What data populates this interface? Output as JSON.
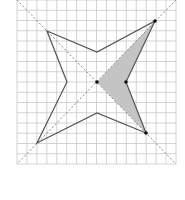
{
  "diagram": {
    "type": "geometry-grid-figure",
    "grid": {
      "x0": 17,
      "y0": 0,
      "x1": 176,
      "y1": 164,
      "cols": 16,
      "rows": 16,
      "line_color": "#c8c8c8"
    },
    "diagonals": [
      {
        "from": [
          17,
          0
        ],
        "to": [
          176,
          164
        ]
      },
      {
        "from": [
          176,
          0
        ],
        "to": [
          17,
          164
        ]
      }
    ],
    "star": {
      "stroke": "#555555",
      "points": [
        [
          47,
          31
        ],
        [
          97,
          52
        ],
        [
          155,
          21
        ],
        [
          126,
          82
        ],
        [
          146,
          133
        ],
        [
          97,
          113
        ],
        [
          37,
          143
        ],
        [
          67,
          82
        ]
      ]
    },
    "shaded_region": {
      "fill": "#c4c4c4",
      "points": [
        [
          97,
          82
        ],
        [
          155,
          21
        ],
        [
          126,
          82
        ],
        [
          146,
          133
        ]
      ]
    },
    "marked_points": [
      {
        "name": "center",
        "pos": [
          97,
          82
        ]
      },
      {
        "name": "right-inner",
        "pos": [
          126,
          82
        ]
      },
      {
        "name": "top-right-vertex",
        "pos": [
          155,
          21
        ]
      },
      {
        "name": "bottom-right-vertex",
        "pos": [
          146,
          133
        ]
      }
    ]
  }
}
